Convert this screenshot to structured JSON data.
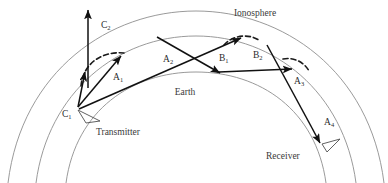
{
  "figure": {
    "type": "diagram",
    "labels": {
      "ionosphere": "Ionosphere",
      "earth": "Earth",
      "transmitter": "Transmitter",
      "receiver": "Receiver"
    },
    "path_labels": [
      {
        "id": "C2",
        "base": "C",
        "sub": "2",
        "x": 101,
        "y": 28
      },
      {
        "id": "A1",
        "base": "A",
        "sub": "1",
        "x": 113,
        "y": 80
      },
      {
        "id": "A2",
        "base": "A",
        "sub": "2",
        "x": 167,
        "y": 61
      },
      {
        "id": "B1",
        "base": "B",
        "sub": "1",
        "x": 222,
        "y": 60
      },
      {
        "id": "B2",
        "base": "B",
        "sub": "2",
        "x": 256,
        "y": 58
      },
      {
        "id": "A3",
        "base": "A",
        "sub": "3",
        "x": 297,
        "y": 83
      },
      {
        "id": "A4",
        "base": "A",
        "sub": "4",
        "x": 327,
        "y": 124
      },
      {
        "id": "C1",
        "base": "C",
        "sub": "1",
        "x": 64,
        "y": 115
      }
    ],
    "point_labels": {
      "ionosphere": {
        "x": 255,
        "y": 16
      },
      "earth": {
        "x": 185,
        "y": 95
      },
      "transmitter": {
        "x": 96,
        "y": 132
      },
      "receiver": {
        "x": 266,
        "y": 156
      }
    },
    "colors": {
      "arc": "#8e8e8e",
      "ray": "#111111",
      "dashed": "#1a1a1a",
      "text": "#2b2b2b",
      "background": "#ffffff"
    },
    "geometry": {
      "arcs": [
        {
          "name": "ionosphere-outer",
          "d": "M 8 183 C 22 70 110 11 196 11 C 282 11 370 70 384 183"
        },
        {
          "name": "ionosphere-inner",
          "d": "M 36 183 C 48 92 118 36 196 36 C 274 36 344 92 356 183"
        },
        {
          "name": "earth-surface",
          "d": "M 66 183 C 76 110 132 72 196 72 C 260 72 316 110 326 183"
        }
      ],
      "dashed_arcs": [
        {
          "name": "refraction-arc-left",
          "d": "M 82 84 C 86 62 104 52 126 53"
        },
        {
          "name": "refraction-arc-a2",
          "d": "M 226 44 C 234 36 248 34 258 40"
        },
        {
          "name": "refraction-arc-b2",
          "d": "M 284 60 C 294 58 304 62 308 70"
        }
      ],
      "rays": [
        {
          "name": "C2-up",
          "from": [
            88,
            86
          ],
          "to": [
            88,
            10
          ],
          "label": "C2"
        },
        {
          "name": "C1-up",
          "from": [
            77,
            106
          ],
          "to": [
            85,
            73
          ],
          "label": "C1"
        },
        {
          "name": "A1",
          "from": [
            77,
            107
          ],
          "to": [
            120,
            56
          ],
          "label": "A1"
        },
        {
          "name": "A2",
          "from": [
            78,
            109
          ],
          "to": [
            240,
            38
          ],
          "label": "A2"
        },
        {
          "name": "B1",
          "from": [
            158,
            38
          ],
          "to": [
            219,
            72
          ],
          "label": "B1"
        },
        {
          "name": "B2",
          "from": [
            219,
            72
          ],
          "to": [
            290,
            69
          ],
          "label": "B2"
        },
        {
          "name": "A3-A4",
          "from": [
            268,
            46
          ],
          "to": [
            320,
            142
          ],
          "label": "A3"
        }
      ]
    }
  }
}
